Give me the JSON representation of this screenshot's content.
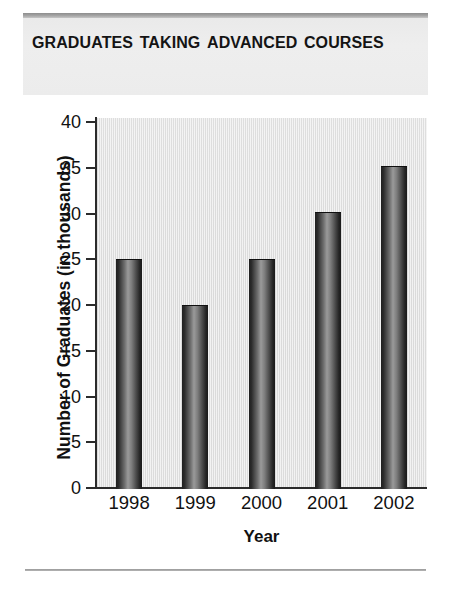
{
  "title": "Graduates Taking Advanced Courses",
  "axis_title_x": "Year",
  "axis_title_y": "Number of Graduates (in thousands)",
  "y_ticks": [
    "40",
    "35",
    "30",
    "25",
    "20",
    "15",
    "10",
    "5",
    "0"
  ],
  "colors": {
    "banner_background": "#ececec",
    "banner_rule": "#9a9a9a",
    "plot_background": "#e4e4e4",
    "axis": "#2b2b2b",
    "bar_dark": "#1f1f1f",
    "bar_light": "#9a9a9a",
    "text": "#111111",
    "bottom_rule": "#a8a8a8"
  },
  "chart_data": {
    "type": "bar",
    "title": "Graduates Taking Advanced Courses",
    "xlabel": "Year",
    "ylabel": "Number of Graduates (in thousands)",
    "categories": [
      "1998",
      "1999",
      "2000",
      "2001",
      "2002"
    ],
    "values": [
      25,
      20,
      25,
      30.2,
      35.2
    ],
    "ylim": [
      0,
      40
    ],
    "ytick_step": 5,
    "yticks": [
      0,
      5,
      10,
      15,
      20,
      25,
      30,
      35,
      40
    ],
    "grid": false,
    "legend": null,
    "units": "thousands"
  }
}
